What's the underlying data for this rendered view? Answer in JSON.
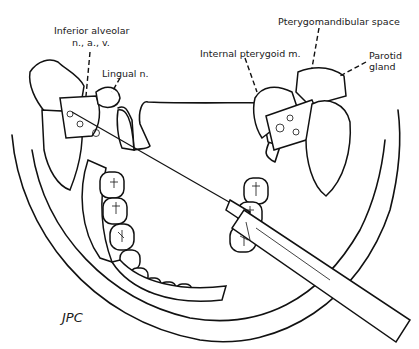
{
  "figure": {
    "labels": {
      "inferior_alveolar": [
        "Inferior alveolar",
        "n., a., v."
      ],
      "lingual_nerve": "Lingual n.",
      "internal_pterygoid": "Internal pterygoid m.",
      "pterygomandibular_space": "Pterygomandibular space",
      "parotid_gland": [
        "Parotid",
        "gland"
      ]
    },
    "signature": "JPC"
  }
}
